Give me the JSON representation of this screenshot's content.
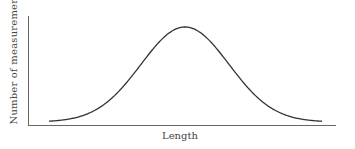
{
  "chart_data": {
    "type": "line",
    "title": "",
    "xlabel": "Length",
    "ylabel": "Number of measurements",
    "grid": false,
    "legend": null,
    "series": [
      {
        "name": "distribution",
        "x": [
          -3,
          -2.5,
          -2,
          -1.5,
          -1,
          -0.5,
          0,
          0.5,
          1,
          1.5,
          2,
          2.5,
          3
        ],
        "values": [
          0.011,
          0.044,
          0.135,
          0.325,
          0.607,
          0.882,
          1.0,
          0.882,
          0.607,
          0.325,
          0.135,
          0.044,
          0.011
        ]
      }
    ],
    "colors": {
      "curve": "#333333",
      "axes": "#555555"
    }
  },
  "labels": {
    "x_axis": "Length",
    "y_axis": "Number of measurements"
  }
}
